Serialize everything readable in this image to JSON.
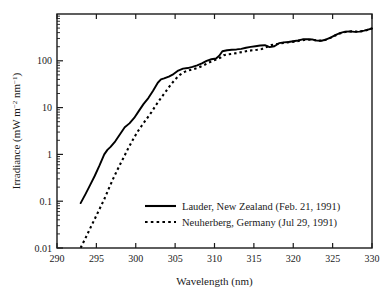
{
  "chart_data": {
    "type": "line",
    "title": "",
    "xlabel": "Wavelength (nm)",
    "ylabel": "Irradiance (mW m−2 nm−1)",
    "ylabel_parts": {
      "prefix": "Irradiance (mW m",
      "sup1": "−2",
      "mid": " nm",
      "sup2": "−1",
      "suffix": ")"
    },
    "xlim": [
      290,
      330
    ],
    "ylim": [
      0.01,
      1000
    ],
    "yscale": "log",
    "xscale": "linear",
    "grid": false,
    "xticks": [
      290,
      295,
      300,
      305,
      310,
      315,
      320,
      325,
      330
    ],
    "xtick_labels": [
      "290",
      "295",
      "300",
      "305",
      "310",
      "315",
      "320",
      "325",
      "330"
    ],
    "yticks": [
      0.01,
      0.1,
      1,
      10,
      100
    ],
    "ytick_labels": [
      "0.01",
      "0.1",
      "1",
      "10",
      "100"
    ],
    "legend_position": "lower right",
    "series": [
      {
        "name": "Lauder, New Zealand (Feb. 21, 1991)",
        "style": "solid",
        "color": "#000000",
        "x": [
          293.0,
          293.6,
          294.2,
          294.8,
          295.4,
          296.0,
          296.4,
          296.8,
          297.4,
          298.0,
          298.6,
          299.2,
          299.8,
          300.4,
          301.0,
          301.6,
          302.2,
          302.8,
          303.2,
          303.6,
          304.2,
          304.8,
          305.4,
          306.0,
          306.6,
          307.2,
          307.8,
          308.4,
          309.0,
          309.6,
          310.2,
          310.6,
          311.0,
          311.6,
          312.2,
          312.8,
          313.4,
          314.0,
          314.6,
          315.2,
          315.8,
          316.4,
          317.0,
          317.6,
          318.2,
          318.8,
          319.4,
          320.0,
          320.6,
          321.2,
          321.8,
          322.4,
          323.0,
          323.6,
          324.2,
          324.8,
          325.4,
          326.0,
          326.6,
          327.2,
          327.8,
          328.4,
          329.0,
          329.6,
          330.0
        ],
        "y": [
          0.091,
          0.14,
          0.22,
          0.35,
          0.58,
          1.0,
          1.25,
          1.45,
          1.9,
          2.7,
          3.8,
          4.6,
          6.0,
          8.5,
          12.0,
          16.0,
          23.0,
          34.0,
          40.0,
          42.0,
          46.0,
          52.0,
          62.0,
          68.0,
          70.0,
          74.0,
          80.0,
          88.0,
          100.0,
          108.0,
          112.0,
          128.0,
          160.0,
          168.0,
          172.0,
          175.0,
          180.0,
          190.0,
          198.0,
          205.0,
          212.0,
          215.0,
          196.0,
          205.0,
          238.0,
          248.0,
          252.0,
          262.0,
          272.0,
          288.0,
          290.0,
          286.0,
          270.0,
          268.0,
          288.0,
          318.0,
          358.0,
          395.0,
          420.0,
          425.0,
          415.0,
          420.0,
          440.0,
          470.0,
          490.0
        ]
      },
      {
        "name": "Neuherberg, Germany (Jul 29, 1991)",
        "style": "dotted",
        "color": "#000000",
        "x": [
          293.0,
          293.6,
          294.2,
          294.8,
          295.4,
          296.0,
          296.6,
          297.2,
          297.8,
          298.4,
          299.0,
          299.6,
          300.2,
          300.8,
          301.4,
          302.0,
          302.6,
          303.2,
          303.8,
          304.4,
          305.0,
          305.6,
          306.2,
          306.8,
          307.4,
          308.0,
          308.6,
          309.2,
          309.8,
          310.4,
          310.8,
          311.2,
          311.8,
          312.4,
          313.0,
          313.6,
          314.2,
          314.8,
          315.4,
          316.0,
          316.6,
          317.2,
          317.8,
          318.4,
          319.0,
          319.6,
          320.2,
          320.8,
          321.4,
          322.0,
          322.6,
          323.2,
          323.8,
          324.4,
          325.0,
          325.6,
          326.2,
          326.8,
          327.4,
          328.0,
          328.6,
          329.2,
          329.8,
          330.0
        ],
        "y": [
          0.0101,
          0.016,
          0.026,
          0.042,
          0.068,
          0.11,
          0.19,
          0.32,
          0.52,
          0.82,
          1.3,
          2.0,
          3.0,
          4.2,
          5.8,
          8.0,
          11.5,
          16.0,
          22.0,
          30.0,
          40.0,
          50.0,
          58.0,
          63.0,
          67.0,
          72.0,
          80.0,
          90.0,
          100.0,
          110.0,
          118.0,
          132.0,
          138.0,
          142.0,
          148.0,
          155.0,
          162.0,
          168.0,
          172.0,
          178.0,
          196.0,
          216.0,
          226.0,
          236.0,
          244.0,
          250.0,
          258.0,
          268.0,
          278.0,
          282.0,
          278.0,
          268.0,
          272.0,
          292.0,
          325.0,
          365.0,
          400.0,
          420.0,
          425.0,
          420.0,
          425.0,
          445.0,
          475.0,
          500.0
        ]
      }
    ],
    "legend_entries": [
      {
        "label": "Lauder, New Zealand (Feb. 21, 1991)",
        "style": "solid"
      },
      {
        "label": "Neuherberg, Germany (Jul 29, 1991)",
        "style": "dotted"
      }
    ]
  }
}
